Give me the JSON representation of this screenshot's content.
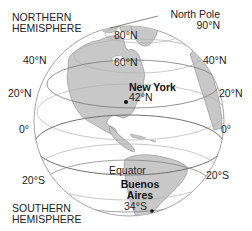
{
  "diagram": {
    "hemispheres": {
      "north_line1": "NORTHERN",
      "north_line2": "HEMISPHERE",
      "south_line1": "SOUTHERN",
      "south_line2": "HEMISPHERE"
    },
    "north_pole": {
      "label": "North Pole",
      "value": "90°N"
    },
    "latitudes": {
      "n80": "80°N",
      "n60": "60°N",
      "n40_left": "40°N",
      "n40_right": "40°N",
      "n20_left": "20°N",
      "n20_right": "20°N",
      "eq_left": "0°",
      "eq_right": "0°",
      "s20_left": "20°S",
      "s20_right": "20°S",
      "equator": "Equator"
    },
    "cities": [
      {
        "name": "New York",
        "latitude": "42°N"
      },
      {
        "name_line1": "Buenos",
        "name_line2": "Aires",
        "latitude": "34°S"
      }
    ],
    "colors": {
      "land": "#c8c8c8",
      "ocean": "#ffffff",
      "outline": "#8a8a8a",
      "lat_line": "#b4b4b4",
      "equator_line": "#7a7a7a",
      "text": "#222222"
    }
  }
}
